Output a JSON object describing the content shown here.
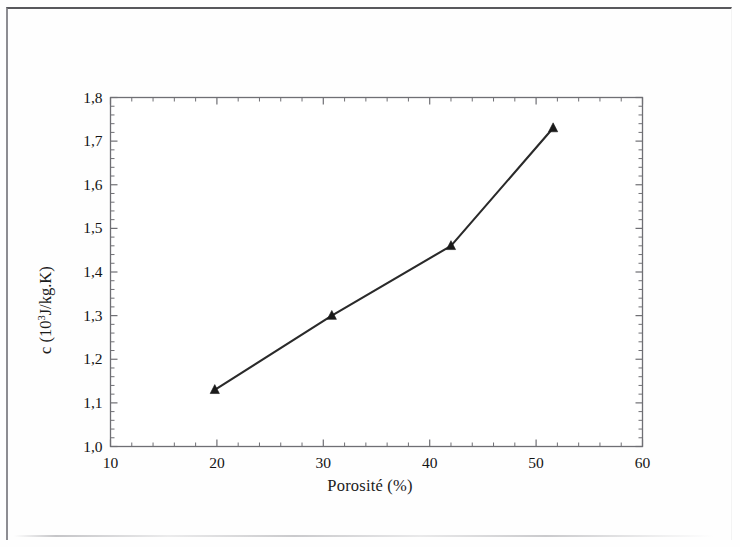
{
  "figure": {
    "background_color": "#fefefe",
    "frame_color": "#6f6f74",
    "line_color": "#2a2a2a",
    "marker_color": "#1a1a1a"
  },
  "chart_data": {
    "type": "line",
    "title": "",
    "subtitle": "",
    "xlabel": "Porosité (%)",
    "ylabel": "c (10³J/kg.K)",
    "ylabel_parts": {
      "prefix": "c (10",
      "exponent": "3",
      "suffix": "J/kg.K)"
    },
    "xlim": [
      10,
      60
    ],
    "ylim": [
      1.0,
      1.8
    ],
    "x_major_ticks": [
      10,
      20,
      30,
      40,
      50,
      60
    ],
    "x_tick_labels": [
      "10",
      "20",
      "30",
      "40",
      "50",
      "60"
    ],
    "x_minor_tick_step": 2,
    "y_major_ticks": [
      1.0,
      1.1,
      1.2,
      1.3,
      1.4,
      1.5,
      1.6,
      1.7,
      1.8
    ],
    "y_tick_labels": [
      "1,0",
      "1,1",
      "1,2",
      "1,3",
      "1,4",
      "1,5",
      "1,6",
      "1,7",
      "1,8"
    ],
    "y_minor_tick_step": 0.02,
    "grid": false,
    "legend": null,
    "legend_position": "none",
    "marker": "triangle-up",
    "series": [
      {
        "name": "c",
        "x": [
          19.8,
          30.8,
          42.0,
          51.6
        ],
        "values": [
          1.13,
          1.3,
          1.46,
          1.73
        ]
      }
    ],
    "points": [
      {
        "x": 19.8,
        "y": 1.13
      },
      {
        "x": 30.8,
        "y": 1.3
      },
      {
        "x": 42.0,
        "y": 1.46
      },
      {
        "x": 51.6,
        "y": 1.73
      }
    ]
  }
}
